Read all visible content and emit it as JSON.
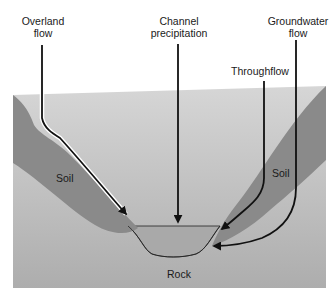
{
  "diagram": {
    "type": "cross-section",
    "colors": {
      "soil": "#8a8a8a",
      "channel_water": "#a9a9a9",
      "rock_top": "#d4d4d4",
      "rock_bottom": "#b2b2b2",
      "arrow": "#111111",
      "arrow_outline": "#ffffff",
      "background": "#ffffff"
    },
    "labels": {
      "overland_flow": {
        "line1": "Overland",
        "line2": "flow"
      },
      "channel_precipitation": {
        "line1": "Channel",
        "line2": "precipitation"
      },
      "groundwater_flow": {
        "line1": "Groundwater",
        "line2": "flow"
      },
      "throughflow": {
        "line1": "Throughflow"
      }
    },
    "regions": {
      "soil_left": "Soil",
      "soil_right": "Soil",
      "rock": "Rock"
    }
  }
}
